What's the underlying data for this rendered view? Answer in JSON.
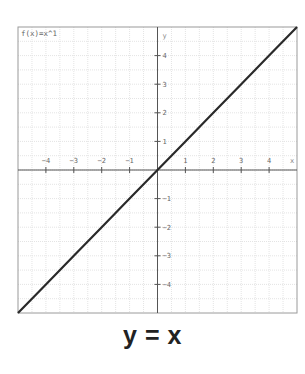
{
  "chart_data": {
    "type": "line",
    "title": "y = x",
    "function_label": "f(x)=x^1",
    "xlabel": "x",
    "ylabel": "y",
    "xlim": [
      -5,
      5
    ],
    "ylim": [
      -5,
      5
    ],
    "grid": true,
    "grid_minor_step": 0.5,
    "x_ticks": [
      -4,
      -3,
      -2,
      -1,
      1,
      2,
      3,
      4
    ],
    "y_ticks": [
      -4,
      -3,
      -2,
      -1,
      1,
      2,
      3,
      4
    ],
    "x_tick_labels": [
      "−4",
      "−3",
      "−2",
      "−1",
      "1",
      "2",
      "3",
      "4"
    ],
    "y_tick_labels": [
      "−4",
      "−3",
      "−2",
      "−1",
      "1",
      "2",
      "3",
      "4"
    ],
    "series": [
      {
        "name": "f(x)=x^1",
        "x": [
          -5,
          -4,
          -3,
          -2,
          -1,
          0,
          1,
          2,
          3,
          4,
          5
        ],
        "values": [
          -5,
          -4,
          -3,
          -2,
          -1,
          0,
          1,
          2,
          3,
          4,
          5
        ]
      }
    ],
    "colors": {
      "line": "#2a2a2a",
      "axis": "#555555",
      "grid": "#e4e4e4",
      "frame": "#9a9a9a",
      "tick_text": "#666666"
    }
  }
}
